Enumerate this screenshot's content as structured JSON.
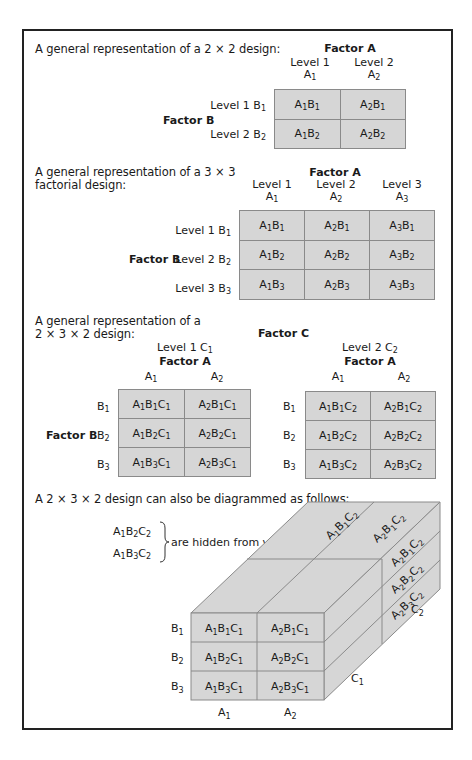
{
  "section1": {
    "caption": "A general representation of a 2 × 2 design:",
    "factor_a_label": "Factor A",
    "factor_b_label": "Factor B",
    "col_headers": [
      {
        "level": "Level 1",
        "sym": "A",
        "sub": "1"
      },
      {
        "level": "Level 2",
        "sym": "A",
        "sub": "2"
      }
    ],
    "row_headers": [
      {
        "level": "Level 1 B",
        "sub": "1"
      },
      {
        "level": "Level 2 B",
        "sub": "2"
      }
    ],
    "cells": [
      [
        [
          "A",
          "1",
          "B",
          "1"
        ],
        [
          "A",
          "2",
          "B",
          "1"
        ]
      ],
      [
        [
          "A",
          "1",
          "B",
          "2"
        ],
        [
          "A",
          "2",
          "B",
          "2"
        ]
      ]
    ]
  },
  "section2": {
    "caption_line1": "A general representation of a 3 × 3",
    "caption_line2": "factorial design:",
    "factor_a_label": "Factor A",
    "factor_b_label": "Factor B",
    "col_headers": [
      {
        "level": "Level 1",
        "sym": "A",
        "sub": "1"
      },
      {
        "level": "Level 2",
        "sym": "A",
        "sub": "2"
      },
      {
        "level": "Level 3",
        "sym": "A",
        "sub": "3"
      }
    ],
    "row_headers": [
      {
        "level": "Level 1 B",
        "sub": "1"
      },
      {
        "level": "Level 2 B",
        "sub": "2"
      },
      {
        "level": "Level 3 B",
        "sub": "3"
      }
    ],
    "cells": [
      [
        [
          "A",
          "1",
          "B",
          "1"
        ],
        [
          "A",
          "2",
          "B",
          "1"
        ],
        [
          "A",
          "3",
          "B",
          "1"
        ]
      ],
      [
        [
          "A",
          "1",
          "B",
          "2"
        ],
        [
          "A",
          "2",
          "B",
          "2"
        ],
        [
          "A",
          "3",
          "B",
          "2"
        ]
      ],
      [
        [
          "A",
          "1",
          "B",
          "3"
        ],
        [
          "A",
          "2",
          "B",
          "3"
        ],
        [
          "A",
          "3",
          "B",
          "3"
        ]
      ]
    ]
  },
  "section3": {
    "caption_line1": "A general representation of a",
    "caption_line2": "2 × 3 × 2 design:",
    "factor_c_label": "Factor C",
    "factor_b_label": "Factor B",
    "tables": [
      {
        "level_label": "Level 1 C",
        "level_sub": "1",
        "factor_a_label": "Factor A",
        "col_headers": [
          {
            "sym": "A",
            "sub": "1"
          },
          {
            "sym": "A",
            "sub": "2"
          }
        ],
        "row_headers": [
          {
            "sym": "B",
            "sub": "1"
          },
          {
            "sym": "B",
            "sub": "2"
          },
          {
            "sym": "B",
            "sub": "3"
          }
        ],
        "cells": [
          [
            [
              "A",
              "1",
              "B",
              "1",
              "C",
              "1"
            ],
            [
              "A",
              "2",
              "B",
              "1",
              "C",
              "1"
            ]
          ],
          [
            [
              "A",
              "1",
              "B",
              "2",
              "C",
              "1"
            ],
            [
              "A",
              "2",
              "B",
              "2",
              "C",
              "1"
            ]
          ],
          [
            [
              "A",
              "1",
              "B",
              "3",
              "C",
              "1"
            ],
            [
              "A",
              "2",
              "B",
              "3",
              "C",
              "1"
            ]
          ]
        ]
      },
      {
        "level_label": "Level 2 C",
        "level_sub": "2",
        "factor_a_label": "Factor A",
        "col_headers": [
          {
            "sym": "A",
            "sub": "1"
          },
          {
            "sym": "A",
            "sub": "2"
          }
        ],
        "row_headers": [
          {
            "sym": "B",
            "sub": "1"
          },
          {
            "sym": "B",
            "sub": "2"
          },
          {
            "sym": "B",
            "sub": "3"
          }
        ],
        "cells": [
          [
            [
              "A",
              "1",
              "B",
              "1",
              "C",
              "2"
            ],
            [
              "A",
              "2",
              "B",
              "1",
              "C",
              "2"
            ]
          ],
          [
            [
              "A",
              "1",
              "B",
              "2",
              "C",
              "2"
            ],
            [
              "A",
              "2",
              "B",
              "2",
              "C",
              "2"
            ]
          ],
          [
            [
              "A",
              "1",
              "B",
              "3",
              "C",
              "2"
            ],
            [
              "A",
              "2",
              "B",
              "3",
              "C",
              "2"
            ]
          ]
        ]
      }
    ]
  },
  "section4": {
    "caption": "A 2 × 3 × 2 design can also be diagrammed as follows:",
    "hidden_cells": [
      [
        "A",
        "1",
        "B",
        "2",
        "C",
        "2"
      ],
      [
        "A",
        "1",
        "B",
        "3",
        "C",
        "2"
      ]
    ],
    "hidden_note": "are hidden from view",
    "front_rows": [
      {
        "sym": "B",
        "sub": "1"
      },
      {
        "sym": "B",
        "sub": "2"
      },
      {
        "sym": "B",
        "sub": "3"
      }
    ],
    "front_cols": [
      {
        "sym": "A",
        "sub": "1"
      },
      {
        "sym": "A",
        "sub": "2"
      }
    ],
    "front_cells": [
      [
        [
          "A",
          "1",
          "B",
          "1",
          "C",
          "1"
        ],
        [
          "A",
          "2",
          "B",
          "1",
          "C",
          "1"
        ]
      ],
      [
        [
          "A",
          "1",
          "B",
          "2",
          "C",
          "1"
        ],
        [
          "A",
          "2",
          "B",
          "2",
          "C",
          "1"
        ]
      ],
      [
        [
          "A",
          "1",
          "B",
          "3",
          "C",
          "1"
        ],
        [
          "A",
          "2",
          "B",
          "3",
          "C",
          "1"
        ]
      ]
    ],
    "top_cells": [
      [
        "A",
        "1",
        "B",
        "1",
        "C",
        "2"
      ],
      [
        "A",
        "2",
        "B",
        "1",
        "C",
        "2"
      ]
    ],
    "side_cells": [
      [
        "A",
        "2",
        "B",
        "1",
        "C",
        "2"
      ],
      [
        "A",
        "2",
        "B",
        "2",
        "C",
        "2"
      ],
      [
        "A",
        "2",
        "B",
        "3",
        "C",
        "2"
      ]
    ],
    "depth_labels": [
      {
        "sym": "C",
        "sub": "1"
      },
      {
        "sym": "C",
        "sub": "2"
      }
    ]
  },
  "colors": {
    "cell_fill": "#d6d6d6",
    "cell_border": "#8a8a8a",
    "frame": "#222222",
    "text": "#1a1a1a"
  }
}
